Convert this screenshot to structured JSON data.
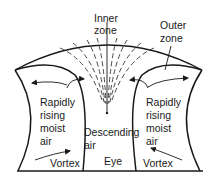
{
  "diagram": {
    "type": "hurricane-cross-section",
    "labels": {
      "inner_zone": [
        "Inner",
        "zone"
      ],
      "outer_zone": [
        "Outer",
        "zone"
      ],
      "left_column": [
        "Rapidly",
        "rising",
        "moist",
        "air"
      ],
      "right_column": [
        "Rapidly",
        "rising",
        "moist",
        "air"
      ],
      "eye_column": [
        "Descending",
        "air"
      ],
      "left_vortex": "Vortex",
      "eye": "Eye",
      "right_vortex": "Vortex"
    },
    "colors": {
      "stroke": "#1a1a1a",
      "background": "#ffffff"
    }
  }
}
